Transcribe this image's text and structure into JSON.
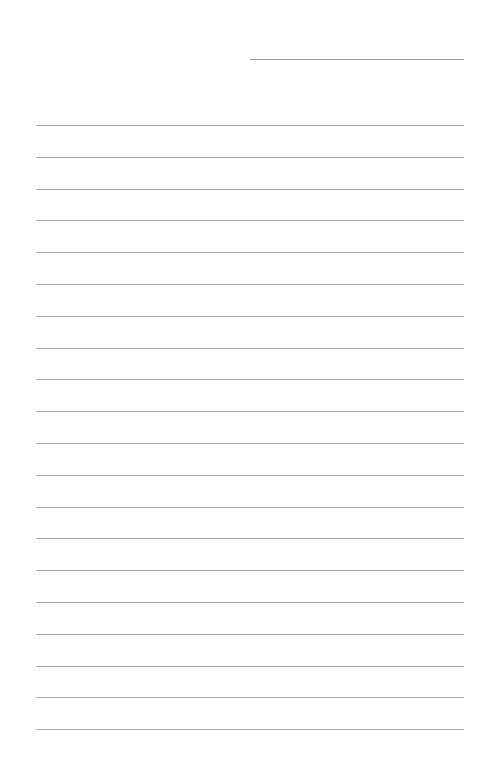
{
  "page": {
    "type": "lined-paper",
    "background": "#ffffff",
    "line_color": "#a8a8a8",
    "header_line": {
      "label": "",
      "x": 250,
      "y": 59,
      "width": 214
    },
    "rules": {
      "count": 20,
      "x": 36,
      "width": 428,
      "start_y": 125,
      "spacing": 31.8
    }
  }
}
